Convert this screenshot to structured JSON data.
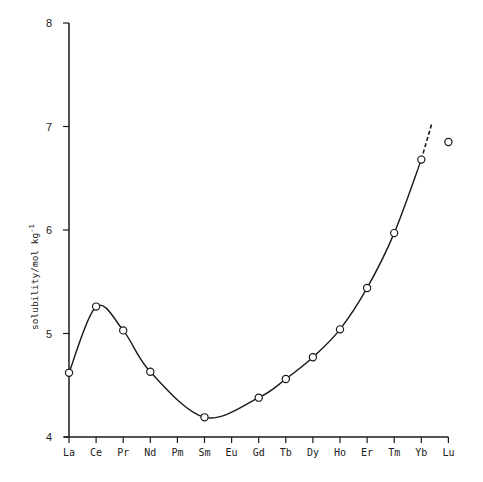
{
  "chart_data": {
    "type": "line",
    "title": "",
    "xlabel": "",
    "ylabel": "solubility/mol kg-1",
    "ylim": [
      4,
      8
    ],
    "yticks": [
      4,
      5,
      6,
      7,
      8
    ],
    "grid": false,
    "categories": [
      "La",
      "Ce",
      "Pr",
      "Nd",
      "Pm",
      "Sm",
      "Eu",
      "Gd",
      "Tb",
      "Dy",
      "Ho",
      "Er",
      "Tm",
      "Yb",
      "Lu"
    ],
    "series": [
      {
        "name": "measured",
        "marker": "open-circle",
        "points": [
          {
            "x": "La",
            "y": 4.62
          },
          {
            "x": "Ce",
            "y": 5.26
          },
          {
            "x": "Pr",
            "y": 5.03
          },
          {
            "x": "Nd",
            "y": 4.63
          },
          {
            "x": "Sm",
            "y": 4.19
          },
          {
            "x": "Gd",
            "y": 4.38
          },
          {
            "x": "Tb",
            "y": 4.56
          },
          {
            "x": "Dy",
            "y": 4.77
          },
          {
            "x": "Ho",
            "y": 5.04
          },
          {
            "x": "Er",
            "y": 5.44
          },
          {
            "x": "Tm",
            "y": 5.97
          },
          {
            "x": "Yb",
            "y": 6.68
          },
          {
            "x": "Lu",
            "y": 6.85
          }
        ]
      }
    ],
    "fit_curve": {
      "style": "solid",
      "through": [
        "La",
        "Ce",
        "Pr",
        "Nd",
        "Sm",
        "Gd",
        "Tb",
        "Dy",
        "Ho",
        "Er",
        "Tm",
        "Yb"
      ],
      "dashed_extension": {
        "from_x": "Yb",
        "from_y": 6.68,
        "to_x_index": 13.4,
        "to_y": 7.04
      }
    },
    "annotations": [
      "Lu point lies off the fitted curve"
    ]
  },
  "labels": {
    "ylabel": "solubility/mol kg",
    "ylabel_sup": "-1"
  }
}
